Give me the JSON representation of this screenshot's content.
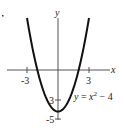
{
  "chart_data": {
    "type": "line",
    "title": "",
    "equation_label": "y = x² − 4",
    "equation_parts": {
      "lhs": "y",
      "eq": " = ",
      "var": "x",
      "exp": "2",
      "rest": " − 4"
    },
    "xlabel": "x",
    "ylabel": "y",
    "x_ticks": [
      {
        "value": -3,
        "label": "-3"
      },
      {
        "value": 3,
        "label": "3"
      }
    ],
    "y_ticks": [
      {
        "value": -3,
        "label": "-3"
      },
      {
        "value": -5,
        "label": "-5"
      }
    ],
    "y_tick_visible_text": {
      "minus3": "3",
      "minus5": "-5"
    },
    "xlim": [
      -5.6,
      5.6
    ],
    "ylim": [
      -5.3,
      5.5
    ],
    "grid": false,
    "series": [
      {
        "name": "y = x^2 - 4",
        "function": "x^2 - 4",
        "x": [
          -3,
          -2.5,
          -2,
          -1.5,
          -1,
          -0.5,
          0,
          0.5,
          1,
          1.5,
          2,
          2.5,
          3
        ],
        "y": [
          5,
          2.25,
          0,
          -1.75,
          -3,
          -3.75,
          -4,
          -3.75,
          -3,
          -1.75,
          0,
          2.25,
          5
        ]
      }
    ],
    "colors": {
      "curve": "#111111",
      "axes": "#555555",
      "text": "#222222"
    }
  }
}
